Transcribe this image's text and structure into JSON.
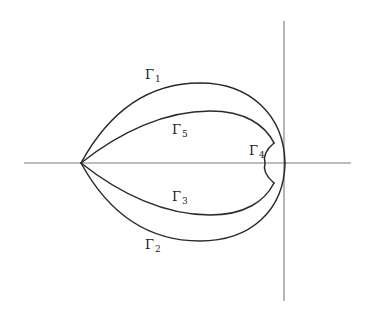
{
  "figure": {
    "type": "contour-diagram",
    "axes": {
      "horizontal": {
        "x1": 24,
        "x2": 351,
        "y": 163
      },
      "vertical": {
        "x": 284,
        "y1": 21,
        "y2": 301
      }
    },
    "vertex": {
      "x": 81,
      "y": 163
    },
    "colors": {
      "curve": "#2a2a2a",
      "axis": "#7a7a7a",
      "background": "#ffffff",
      "text": "#222222"
    },
    "curves": [
      {
        "id": "gamma1",
        "path": "M81,163 C110,110 150,83 200,83 C250,83 284,115 285,163"
      },
      {
        "id": "gamma2",
        "path": "M81,163 C110,216 150,241 200,241 C250,241 284,211 285,163"
      },
      {
        "id": "gamma5",
        "path": "M81,163 C120,132 165,111 210,111 C245,111 265,125 274,143"
      },
      {
        "id": "gamma3",
        "path": "M81,163 C120,194 165,215 210,215 C245,215 265,201 274,183"
      },
      {
        "id": "gamma4",
        "path": "M274,143 Q262,153 265,163 Q262,173 274,183"
      }
    ],
    "labels": [
      {
        "id": "gamma1",
        "symbol": "Γ",
        "subscript": "1",
        "x": 145,
        "y": 68
      },
      {
        "id": "gamma5",
        "symbol": "Γ",
        "subscript": "5",
        "x": 172,
        "y": 123
      },
      {
        "id": "gamma4",
        "symbol": "Γ",
        "subscript": "4",
        "x": 249,
        "y": 144
      },
      {
        "id": "gamma3",
        "symbol": "Γ",
        "subscript": "3",
        "x": 172,
        "y": 190
      },
      {
        "id": "gamma2",
        "symbol": "Γ",
        "subscript": "2",
        "x": 145,
        "y": 238
      }
    ]
  }
}
